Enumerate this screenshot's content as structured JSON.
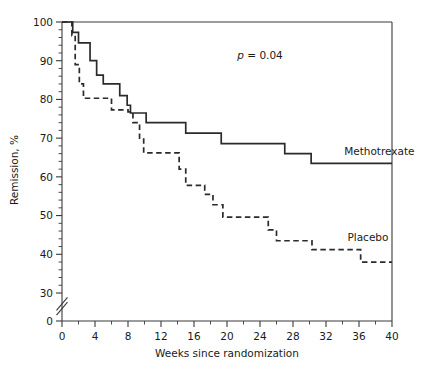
{
  "chart_data": {
    "type": "line",
    "title": "",
    "subtitle": "",
    "xlabel": "Weeks since randomization",
    "ylabel": "Remission, %",
    "xlim": [
      0,
      40
    ],
    "ylim": [
      0,
      100
    ],
    "y_axis_break": true,
    "y_break_between": [
      0,
      30
    ],
    "grid": false,
    "legend_position": "inline-right",
    "xticks": [
      0,
      4,
      8,
      12,
      16,
      20,
      24,
      28,
      32,
      36,
      40
    ],
    "xticklabels": [
      "0",
      "4",
      "8",
      "12",
      "16",
      "20",
      "24",
      "28",
      "32",
      "36",
      "40"
    ],
    "x_minor_tick_interval": 2,
    "yticks": [
      0,
      30,
      40,
      50,
      60,
      70,
      80,
      90,
      100
    ],
    "yticklabels": [
      "0",
      "30",
      "40",
      "50",
      "60",
      "70",
      "80",
      "90",
      "100"
    ],
    "y_minor_tick_interval": 2,
    "annotations": [
      {
        "name": "p-value",
        "text_prefix": "p",
        "text_rest": " = 0.04",
        "x": 24.0,
        "y": 91.5
      }
    ],
    "series": [
      {
        "name": "Methotrexate",
        "style": "solid",
        "color": "#2b2b2b",
        "label_x": 34.2,
        "label_y": 66.5,
        "steps": [
          [
            0,
            100
          ],
          [
            1.3,
            100
          ],
          [
            1.3,
            97.3
          ],
          [
            2.0,
            97.3
          ],
          [
            2.0,
            94.6
          ],
          [
            3.4,
            94.6
          ],
          [
            3.4,
            90.0
          ],
          [
            4.2,
            90.0
          ],
          [
            4.2,
            86.3
          ],
          [
            5.0,
            86.3
          ],
          [
            5.0,
            84.0
          ],
          [
            7.0,
            84.0
          ],
          [
            7.0,
            81.0
          ],
          [
            7.9,
            81.0
          ],
          [
            7.9,
            78.5
          ],
          [
            8.3,
            78.5
          ],
          [
            8.3,
            76.5
          ],
          [
            10.2,
            76.5
          ],
          [
            10.2,
            74.0
          ],
          [
            15.0,
            74.0
          ],
          [
            15.0,
            71.3
          ],
          [
            19.3,
            71.3
          ],
          [
            19.3,
            68.6
          ],
          [
            27.0,
            68.6
          ],
          [
            27.0,
            66.0
          ],
          [
            30.2,
            66.0
          ],
          [
            30.2,
            63.5
          ],
          [
            40,
            63.5
          ]
        ]
      },
      {
        "name": "Placebo",
        "style": "dashed",
        "color": "#2b2b2b",
        "label_x": 34.6,
        "label_y": 44.5,
        "steps": [
          [
            0,
            100
          ],
          [
            1.2,
            100
          ],
          [
            1.2,
            96.5
          ],
          [
            1.6,
            96.5
          ],
          [
            1.6,
            89.0
          ],
          [
            2.1,
            89.0
          ],
          [
            2.1,
            84.0
          ],
          [
            2.6,
            84.0
          ],
          [
            2.6,
            80.3
          ],
          [
            6.0,
            80.3
          ],
          [
            6.0,
            77.3
          ],
          [
            8.0,
            77.3
          ],
          [
            8.0,
            76.8
          ],
          [
            8.6,
            76.8
          ],
          [
            8.6,
            74.0
          ],
          [
            9.4,
            74.0
          ],
          [
            9.4,
            70.0
          ],
          [
            9.9,
            70.0
          ],
          [
            9.9,
            66.2
          ],
          [
            14.2,
            66.2
          ],
          [
            14.2,
            62.0
          ],
          [
            15.0,
            62.0
          ],
          [
            15.0,
            57.8
          ],
          [
            17.3,
            57.8
          ],
          [
            17.3,
            55.5
          ],
          [
            18.3,
            55.5
          ],
          [
            18.3,
            52.8
          ],
          [
            19.5,
            52.8
          ],
          [
            19.5,
            49.6
          ],
          [
            25.0,
            49.6
          ],
          [
            25.0,
            46.3
          ],
          [
            26.0,
            46.3
          ],
          [
            26.0,
            43.5
          ],
          [
            30.3,
            43.5
          ],
          [
            30.3,
            41.2
          ],
          [
            36.2,
            41.2
          ],
          [
            36.2,
            38.0
          ],
          [
            40,
            38.0
          ]
        ]
      }
    ]
  }
}
